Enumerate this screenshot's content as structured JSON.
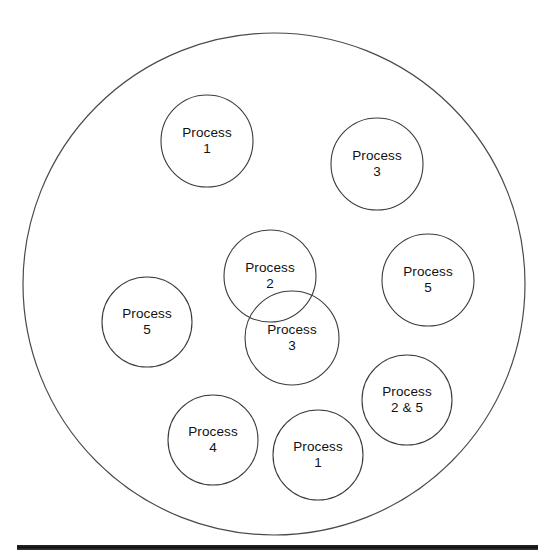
{
  "diagram": {
    "type": "venn-cluster",
    "title": "",
    "background_color": "#ffffff",
    "stroke_color": "#3b3b3b",
    "text_color": "#111111",
    "outer_boundary": {
      "name": "system-boundary",
      "cx": 274,
      "cy": 284,
      "r": 251
    },
    "footer_rule": {
      "name": "footer-rule",
      "x": 17,
      "y": 545,
      "width": 521,
      "height": 5,
      "color": "#1a1a1a"
    },
    "nodes": [
      {
        "id": "process-1-top",
        "label_line1": "Process",
        "label_line2": "1",
        "cx": 207,
        "cy": 141,
        "r": 46
      },
      {
        "id": "process-3-top-right",
        "label_line1": "Process",
        "label_line2": "3",
        "cx": 377,
        "cy": 164,
        "r": 46
      },
      {
        "id": "process-2-center",
        "label_line1": "Process",
        "label_line2": "2",
        "cx": 270,
        "cy": 276,
        "r": 46
      },
      {
        "id": "process-3-center",
        "label_line1": "Process",
        "label_line2": "3",
        "cx": 292,
        "cy": 338,
        "r": 47
      },
      {
        "id": "process-5-right",
        "label_line1": "Process",
        "label_line2": "5",
        "cx": 428,
        "cy": 280,
        "r": 46
      },
      {
        "id": "process-5-left",
        "label_line1": "Process",
        "label_line2": "5",
        "cx": 147,
        "cy": 322,
        "r": 45
      },
      {
        "id": "process-2and5-bottom-right",
        "label_line1": "Process",
        "label_line2": "2 & 5",
        "cx": 407,
        "cy": 400,
        "r": 45
      },
      {
        "id": "process-4-bottom",
        "label_line1": "Process",
        "label_line2": "4",
        "cx": 213,
        "cy": 440,
        "r": 45
      },
      {
        "id": "process-1-bottom",
        "label_line1": "Process",
        "label_line2": "1",
        "cx": 318,
        "cy": 455,
        "r": 45
      }
    ]
  }
}
